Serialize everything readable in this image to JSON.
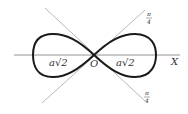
{
  "diagram": {
    "type": "lemniscate-of-bernoulli",
    "labels": {
      "origin": "O",
      "x_axis": "X",
      "left_half_width": "a√2",
      "right_half_width": "a√2",
      "angle_top": {
        "num": "π",
        "den": "4"
      },
      "angle_bottom": {
        "num": "π",
        "den": "4"
      }
    },
    "colors": {
      "curve": "#1a1a1a",
      "lines": "#888888",
      "text": "#333333"
    }
  }
}
